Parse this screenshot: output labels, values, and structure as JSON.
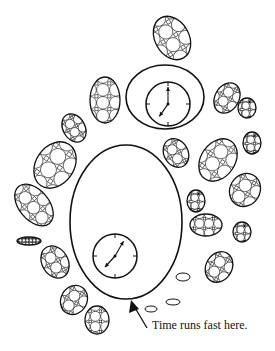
{
  "diagram": {
    "caption": "Time runs fast here.",
    "colors": {
      "stroke": "#111111",
      "background": "#ffffff"
    },
    "regions": [
      {
        "name": "small-region",
        "cx": 165,
        "cy": 97,
        "rx": 39,
        "ry": 32,
        "clock": {
          "cx": 168,
          "cy": 104,
          "r": 22,
          "hour_angle": 215,
          "minute_angle": 0
        }
      },
      {
        "name": "large-region",
        "cx": 126,
        "cy": 222,
        "rx": 56,
        "ry": 77,
        "clock": {
          "cx": 115,
          "cy": 256,
          "r": 22,
          "hour_angle": 222,
          "minute_angle": 30
        }
      }
    ],
    "blobs": [
      {
        "cx": 172,
        "cy": 38,
        "rx": 17,
        "ry": 23,
        "rot": -30
      },
      {
        "cx": 105,
        "cy": 100,
        "rx": 15,
        "ry": 23,
        "rot": 0
      },
      {
        "cx": 74,
        "cy": 128,
        "rx": 11,
        "ry": 15,
        "rot": -30
      },
      {
        "cx": 55,
        "cy": 165,
        "rx": 19,
        "ry": 25,
        "rot": 35
      },
      {
        "cx": 34,
        "cy": 205,
        "rx": 15,
        "ry": 24,
        "rot": -40
      },
      {
        "cx": 29,
        "cy": 241,
        "rx": 12,
        "ry": 4,
        "rot": 0
      },
      {
        "cx": 55,
        "cy": 262,
        "rx": 13,
        "ry": 17,
        "rot": -30
      },
      {
        "cx": 74,
        "cy": 300,
        "rx": 13,
        "ry": 15,
        "rot": 30
      },
      {
        "cx": 97,
        "cy": 320,
        "rx": 12,
        "ry": 14,
        "rot": 0
      },
      {
        "cx": 227,
        "cy": 98,
        "rx": 12,
        "ry": 16,
        "rot": 30
      },
      {
        "cx": 247,
        "cy": 108,
        "rx": 9,
        "ry": 10,
        "rot": 0
      },
      {
        "cx": 252,
        "cy": 143,
        "rx": 9,
        "ry": 11,
        "rot": 0
      },
      {
        "cx": 176,
        "cy": 153,
        "rx": 12,
        "ry": 15,
        "rot": -30
      },
      {
        "cx": 218,
        "cy": 160,
        "rx": 17,
        "ry": 23,
        "rot": 35
      },
      {
        "cx": 245,
        "cy": 190,
        "rx": 15,
        "ry": 17,
        "rot": 30
      },
      {
        "cx": 196,
        "cy": 201,
        "rx": 9,
        "ry": 11,
        "rot": 0
      },
      {
        "cx": 206,
        "cy": 225,
        "rx": 16,
        "ry": 11,
        "rot": 0
      },
      {
        "cx": 242,
        "cy": 232,
        "rx": 9,
        "ry": 10,
        "rot": 0
      },
      {
        "cx": 219,
        "cy": 267,
        "rx": 13,
        "ry": 16,
        "rot": 30
      }
    ],
    "pebbles": [
      {
        "cx": 183,
        "cy": 277,
        "rx": 7,
        "ry": 4
      },
      {
        "cx": 151,
        "cy": 309,
        "rx": 6,
        "ry": 3
      },
      {
        "cx": 173,
        "cy": 302,
        "rx": 7,
        "ry": 3
      }
    ],
    "arrow": {
      "from": [
        147,
        328
      ],
      "to": [
        131,
        300
      ]
    }
  }
}
